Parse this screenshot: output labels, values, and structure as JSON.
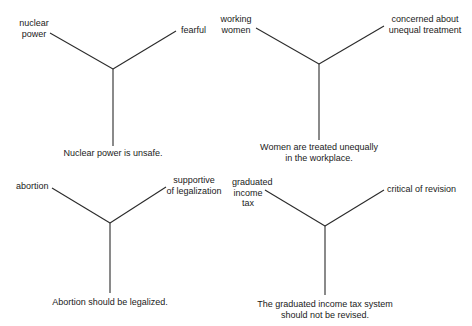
{
  "diagrams": [
    {
      "concept": [
        "nuclear",
        "power"
      ],
      "attitude": [
        "fearful"
      ],
      "belief": [
        "Nuclear power is unsafe."
      ]
    },
    {
      "concept": [
        "working",
        "women"
      ],
      "attitude": [
        "concerned about",
        "unequal treatment"
      ],
      "belief": [
        "Women are treated unequally",
        "in the workplace."
      ]
    },
    {
      "concept": [
        "abortion"
      ],
      "attitude": [
        "supportive",
        "of legalization"
      ],
      "belief": [
        "Abortion should be legalized."
      ]
    },
    {
      "concept": [
        "graduated",
        "income",
        "tax"
      ],
      "attitude": [
        "critical of revision"
      ],
      "belief": [
        "The graduated income tax system",
        "should not be revised."
      ]
    }
  ],
  "colors": {
    "line": "#2a2a2a",
    "text": "#1a1a1a",
    "background": "#ffffff"
  }
}
